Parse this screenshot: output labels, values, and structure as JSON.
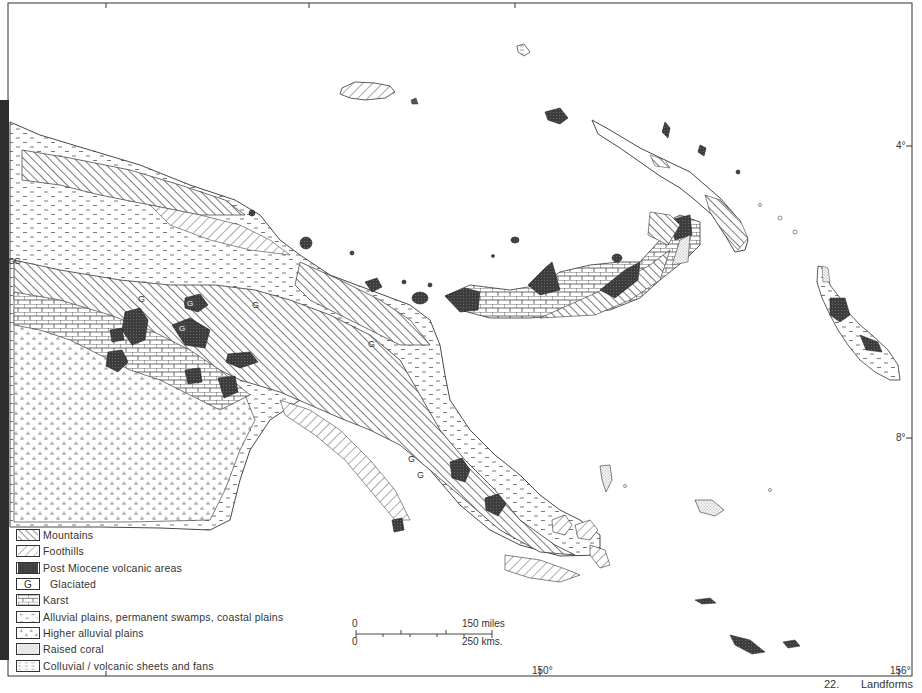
{
  "map": {
    "title_number": "22.",
    "title": "Landforms",
    "colors": {
      "ink": "#2a2a2a",
      "volcanic_fill": "#4a4a4a",
      "paper": "#ffffff",
      "frame": "#333333"
    },
    "longitude_labels": [
      {
        "label": "150°",
        "x": 540
      },
      {
        "label": "156°",
        "x": 899
      }
    ],
    "latitude_labels": [
      {
        "label": "4°",
        "y": 145
      },
      {
        "label": "8°",
        "y": 437
      }
    ],
    "scale_bar": {
      "top_start": "0",
      "top_end": "150 miles",
      "bottom_start": "0",
      "bottom_end": "250 kms."
    },
    "glaciated_marker": "G",
    "legend": [
      {
        "pattern": "mountains-hatch",
        "label": "Mountains"
      },
      {
        "pattern": "foothills-hatch",
        "label": "Foothills"
      },
      {
        "pattern": "volcanic-dense",
        "label": "Post Miocene volcanic areas"
      },
      {
        "pattern": "glaciated-g",
        "label": "Glaciated",
        "symbol": "G"
      },
      {
        "pattern": "karst-brick",
        "label": "Karst"
      },
      {
        "pattern": "alluvial-dash",
        "label": "Alluvial plains, permanent swamps, coastal plains"
      },
      {
        "pattern": "higher-alluvial",
        "label": "Higher alluvial plains"
      },
      {
        "pattern": "raised-coral-dots",
        "label": "Raised coral"
      },
      {
        "pattern": "colluvial-dashed-lines",
        "label": "Colluvial / volcanic sheets and fans"
      }
    ]
  }
}
